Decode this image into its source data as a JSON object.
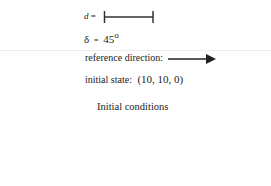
{
  "step_length": {
    "symbol": "d",
    "equals": "="
  },
  "angle": {
    "symbol": "δ",
    "equals": "=",
    "value": "45",
    "unit": "o"
  },
  "reference_direction": {
    "label": "reference direction:"
  },
  "initial_state": {
    "label": "initial state:",
    "value": "(10, 10, 0)"
  },
  "caption": "Initial conditions"
}
